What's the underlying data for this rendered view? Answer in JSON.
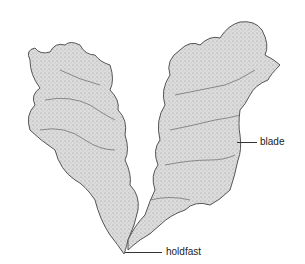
{
  "figure": {
    "labels": [
      {
        "id": "blade",
        "text": "blade"
      },
      {
        "id": "holdfast",
        "text": "holdfast"
      }
    ]
  },
  "colors": {
    "fill": "#d6d6d6",
    "stroke": "#555555",
    "shade": "#8a8a8a"
  }
}
